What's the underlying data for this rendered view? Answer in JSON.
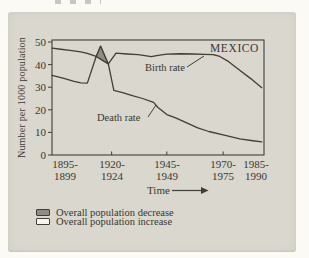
{
  "chart_data": {
    "type": "line",
    "title": "MEXICO",
    "ylabel": "Number per 1000 population",
    "xlabel": "Time",
    "ylim": [
      0,
      50
    ],
    "xlim": [
      1895,
      1991
    ],
    "grid": false,
    "y_ticks": [
      0,
      10,
      20,
      30,
      40,
      50
    ],
    "x_tick_years": [
      1897,
      1922,
      1947,
      1972.5,
      1987.5
    ],
    "x_tick_labels": [
      [
        "1895-",
        "1899"
      ],
      [
        "1920-",
        "1924"
      ],
      [
        "1945-",
        "1949"
      ],
      [
        "1970-",
        "1975"
      ],
      [
        "1985-",
        "1990"
      ]
    ],
    "series": [
      {
        "name": "Birth rate",
        "points": [
          [
            1895,
            47.3
          ],
          [
            1899,
            46.8
          ],
          [
            1904,
            46.2
          ],
          [
            1908,
            45.6
          ],
          [
            1911,
            45.0
          ],
          [
            1915,
            43.6
          ],
          [
            1920.5,
            40.3
          ],
          [
            1924,
            45.1
          ],
          [
            1929,
            44.7
          ],
          [
            1934,
            44.4
          ],
          [
            1940,
            43.5
          ],
          [
            1943,
            44.1
          ],
          [
            1947,
            44.6
          ],
          [
            1953,
            44.8
          ],
          [
            1959,
            44.7
          ],
          [
            1964,
            44.5
          ],
          [
            1968,
            44.4
          ],
          [
            1971,
            43.6
          ],
          [
            1975,
            41.3
          ],
          [
            1980,
            37.5
          ],
          [
            1985,
            33.8
          ],
          [
            1990,
            29.8
          ]
        ]
      },
      {
        "name": "Death rate",
        "points": [
          [
            1895,
            35.2
          ],
          [
            1900,
            34.0
          ],
          [
            1905,
            32.6
          ],
          [
            1908,
            31.9
          ],
          [
            1911,
            31.8
          ],
          [
            1915,
            43.6
          ],
          [
            1917,
            48.2
          ],
          [
            1920.5,
            40.3
          ],
          [
            1923,
            28.6
          ],
          [
            1927,
            27.6
          ],
          [
            1931,
            26.4
          ],
          [
            1936,
            25.0
          ],
          [
            1941,
            23.3
          ],
          [
            1943,
            21.0
          ],
          [
            1947,
            17.9
          ],
          [
            1951,
            16.4
          ],
          [
            1956,
            14.2
          ],
          [
            1961,
            12.0
          ],
          [
            1966,
            10.4
          ],
          [
            1973,
            8.8
          ],
          [
            1980,
            7.1
          ],
          [
            1986,
            6.3
          ],
          [
            1990,
            5.8
          ]
        ]
      }
    ],
    "decrease_region": {
      "description": "period where death rate exceeds birth rate",
      "points": [
        [
          1915,
          43.6
        ],
        [
          1917,
          48.2
        ],
        [
          1920.5,
          40.3
        ]
      ]
    },
    "legend": [
      {
        "label": "Overall population decrease",
        "swatch": "gray-filled-box"
      },
      {
        "label": "Overall population increase",
        "swatch": "white-box"
      }
    ],
    "legend_position": "bottom-left",
    "colors": {
      "card_bg": "#d9d7ce",
      "line": "#413e37",
      "region_fill": "#8e8d85",
      "swatch_empty": "#f6f4ec",
      "text": "#3a372f"
    }
  }
}
